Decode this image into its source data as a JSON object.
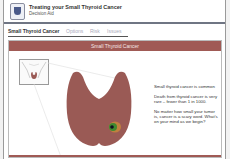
{
  "header": {
    "title": "Treating your Small Thyroid Cancer",
    "subtitle": "Decision Aid",
    "logo_icon": "university-shield-icon"
  },
  "tabs": [
    {
      "label": "Small Thyroid Cancer",
      "active": true
    },
    {
      "label": "Options",
      "active": false
    },
    {
      "label": "Risk",
      "active": false
    },
    {
      "label": "Issues",
      "active": false
    }
  ],
  "content": {
    "banner_title": "Small Thyroid Cancer",
    "info": [
      "Small thyroid cancer is common",
      "Death from thyroid cancer is very rare – fewer than 1 in 1000.",
      "No matter how small your tumor is, cancer is a scary word. What's on your mind as we begin?"
    ],
    "illustration": "thyroid-gland-with-nodule",
    "colors": {
      "banner": "#a05a55",
      "thyroid": "#9a5a55",
      "nodule": "#2f7a2a"
    }
  }
}
